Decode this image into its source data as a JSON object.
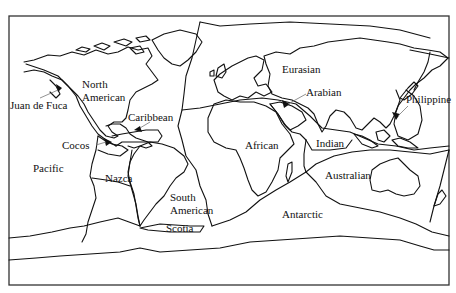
{
  "map": {
    "title": "Tectonic plates",
    "frame": {
      "x": 9,
      "y": 16,
      "width": 440,
      "height": 269
    },
    "colors": {
      "line": "#111111",
      "background": "#ffffff",
      "leader": "#777777"
    },
    "labels": {
      "north_american_1": "North",
      "north_american_2": "American",
      "juan_de_fuca": "Juan de Fuca",
      "caribbean": "Caribbean",
      "cocos": "Cocos",
      "pacific": "Pacific",
      "nazca": "Nazca",
      "south_american_1": "South",
      "south_american_2": "American",
      "scotia": "Scotia",
      "african": "African",
      "antarctic": "Antarctic",
      "eurasian": "Eurasian",
      "arabian": "Arabian",
      "indian": "Indian",
      "australian": "Australian",
      "philippine": "Philippine"
    },
    "motion_arrows": [
      "juan-de-fuca",
      "cocos",
      "caribbean",
      "arabian",
      "philippine"
    ]
  }
}
